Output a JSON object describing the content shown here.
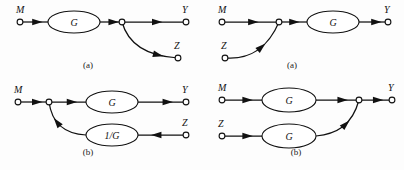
{
  "figure": {
    "background": "#fdfdfd",
    "stroke": "#111111",
    "node_fill": "#ffffff",
    "width": 404,
    "height": 170
  },
  "panels": [
    {
      "id": "top-left",
      "caption": "(a)",
      "caption_x": 88,
      "caption_y": 68,
      "terminals": [
        {
          "name": "M",
          "label": "M",
          "x": 20,
          "y": 22,
          "label_x": 16,
          "label_y": 13,
          "type": "source"
        },
        {
          "name": "Y",
          "label": "Y",
          "x": 186,
          "y": 22,
          "label_x": 182,
          "label_y": 13,
          "type": "sink"
        },
        {
          "name": "Z",
          "label": "Z",
          "x": 178,
          "y": 58,
          "label_x": 174,
          "label_y": 49,
          "type": "sink"
        },
        {
          "name": "junction",
          "label": "",
          "x": 122,
          "y": 22,
          "type": "junction"
        }
      ],
      "blocks": [
        {
          "name": "G",
          "label": "G",
          "cx": 74,
          "cy": 22,
          "rx": 26,
          "ry": 11
        }
      ],
      "edges": [
        {
          "name": "m-to-g",
          "kind": "line",
          "from": [
            20,
            22
          ],
          "to": [
            48,
            22
          ],
          "arrow_at": 0.62
        },
        {
          "name": "g-to-junction",
          "kind": "line",
          "from": [
            100,
            22
          ],
          "to": [
            122,
            22
          ],
          "arrow_at": 0.62
        },
        {
          "name": "junction-to-y",
          "kind": "line",
          "from": [
            122,
            22
          ],
          "to": [
            186,
            22
          ],
          "arrow_at": 0.55
        },
        {
          "name": "junction-to-z",
          "kind": "curve",
          "path": "M 122 22 C 128 44 146 56 178 58",
          "arrow_at": 0.72
        }
      ]
    },
    {
      "id": "top-right",
      "caption": "(a)",
      "caption_x": 292,
      "caption_y": 68,
      "terminals": [
        {
          "name": "M",
          "label": "M",
          "x": 222,
          "y": 22,
          "label_x": 218,
          "label_y": 13,
          "type": "source"
        },
        {
          "name": "Z",
          "label": "Z",
          "x": 225,
          "y": 58,
          "label_x": 221,
          "label_y": 49,
          "type": "source"
        },
        {
          "name": "Y",
          "label": "Y",
          "x": 388,
          "y": 22,
          "label_x": 384,
          "label_y": 13,
          "type": "sink"
        },
        {
          "name": "junction",
          "label": "",
          "x": 279,
          "y": 22,
          "type": "junction"
        }
      ],
      "blocks": [
        {
          "name": "G",
          "label": "G",
          "cx": 333,
          "cy": 22,
          "rx": 26,
          "ry": 11
        }
      ],
      "edges": [
        {
          "name": "m-to-junction",
          "kind": "line",
          "from": [
            222,
            22
          ],
          "to": [
            279,
            22
          ],
          "arrow_at": 0.55
        },
        {
          "name": "junction-to-g",
          "kind": "line",
          "from": [
            279,
            22
          ],
          "to": [
            307,
            22
          ],
          "arrow_at": 0.55
        },
        {
          "name": "g-to-y",
          "kind": "line",
          "from": [
            359,
            22
          ],
          "to": [
            388,
            22
          ],
          "arrow_at": 0.6
        },
        {
          "name": "z-to-junction",
          "kind": "curve",
          "path": "M 225 58 C 249 60 268 48 279 22",
          "arrow_at": 0.56
        }
      ]
    },
    {
      "id": "bottom-left",
      "caption": "(b)",
      "caption_x": 88,
      "caption_y": 155,
      "terminals": [
        {
          "name": "M",
          "label": "M",
          "x": 18,
          "y": 102,
          "label_x": 14,
          "label_y": 93,
          "type": "source"
        },
        {
          "name": "Y",
          "label": "Y",
          "x": 186,
          "y": 102,
          "label_x": 182,
          "label_y": 93,
          "type": "sink"
        },
        {
          "name": "Z",
          "label": "Z",
          "x": 186,
          "y": 135,
          "label_x": 182,
          "label_y": 126,
          "type": "source"
        },
        {
          "name": "junction",
          "label": "",
          "x": 49,
          "y": 102,
          "type": "junction"
        }
      ],
      "blocks": [
        {
          "name": "G",
          "label": "G",
          "cx": 112,
          "cy": 102,
          "rx": 26,
          "ry": 11
        },
        {
          "name": "G-inverse",
          "label": "1/G",
          "cx": 112,
          "cy": 135,
          "rx": 26,
          "ry": 11
        }
      ],
      "edges": [
        {
          "name": "m-to-junction",
          "kind": "line",
          "from": [
            18,
            102
          ],
          "to": [
            49,
            102
          ],
          "arrow_at": 0.62
        },
        {
          "name": "junction-to-g",
          "kind": "line",
          "from": [
            49,
            102
          ],
          "to": [
            86,
            102
          ],
          "arrow_at": 0.62
        },
        {
          "name": "g-to-y",
          "kind": "line",
          "from": [
            138,
            102
          ],
          "to": [
            186,
            102
          ],
          "arrow_at": 0.62
        },
        {
          "name": "z-to-ginv",
          "kind": "line",
          "from": [
            186,
            135
          ],
          "to": [
            138,
            135
          ],
          "arrow_at": 0.62
        },
        {
          "name": "ginv-to-junction",
          "kind": "curve",
          "path": "M 86 135 C 66 134 52 124 49 102",
          "arrow_at": 0.6
        }
      ]
    },
    {
      "id": "bottom-right",
      "caption": "(b)",
      "caption_x": 296,
      "caption_y": 155,
      "terminals": [
        {
          "name": "M",
          "label": "M",
          "x": 222,
          "y": 100,
          "label_x": 218,
          "label_y": 91,
          "type": "source"
        },
        {
          "name": "Z",
          "label": "Z",
          "x": 222,
          "y": 136,
          "label_x": 218,
          "label_y": 127,
          "type": "source"
        },
        {
          "name": "Y",
          "label": "Y",
          "x": 392,
          "y": 100,
          "label_x": 388,
          "label_y": 91,
          "type": "sink"
        },
        {
          "name": "junction",
          "label": "",
          "x": 359,
          "y": 100,
          "type": "junction"
        }
      ],
      "blocks": [
        {
          "name": "G-upper",
          "label": "G",
          "cx": 289,
          "cy": 100,
          "rx": 27,
          "ry": 12
        },
        {
          "name": "G-lower",
          "label": "G",
          "cx": 289,
          "cy": 136,
          "rx": 27,
          "ry": 12
        }
      ],
      "edges": [
        {
          "name": "m-to-g-upper",
          "kind": "line",
          "from": [
            222,
            100
          ],
          "to": [
            262,
            100
          ],
          "arrow_at": 0.64
        },
        {
          "name": "g-upper-to-junction",
          "kind": "line",
          "from": [
            316,
            100
          ],
          "to": [
            359,
            100
          ],
          "arrow_at": 0.62
        },
        {
          "name": "junction-to-y",
          "kind": "line",
          "from": [
            359,
            100
          ],
          "to": [
            392,
            100
          ],
          "arrow_at": 0.58
        },
        {
          "name": "z-to-g-lower",
          "kind": "line",
          "from": [
            222,
            136
          ],
          "to": [
            262,
            136
          ],
          "arrow_at": 0.64
        },
        {
          "name": "g-lower-to-junction",
          "kind": "curve",
          "path": "M 316 136 C 336 134 352 126 359 100",
          "arrow_at": 0.54
        }
      ]
    }
  ]
}
